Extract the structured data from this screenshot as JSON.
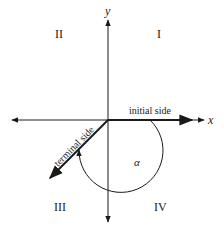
{
  "diagram": {
    "type": "angle-in-standard-position",
    "axes": {
      "x_label": "x",
      "y_label": "y"
    },
    "quadrants": [
      {
        "id": "II",
        "label": "II"
      },
      {
        "id": "I",
        "label": "I"
      },
      {
        "id": "III",
        "label": "III"
      },
      {
        "id": "IV",
        "label": "IV"
      }
    ],
    "initial_side_label": "initial side",
    "terminal_side_label": "terminal side",
    "angle_label": "α",
    "terminal_angle_degrees": 225,
    "colors": {
      "stroke": "#1a1a1a",
      "background": "#ffffff"
    }
  }
}
